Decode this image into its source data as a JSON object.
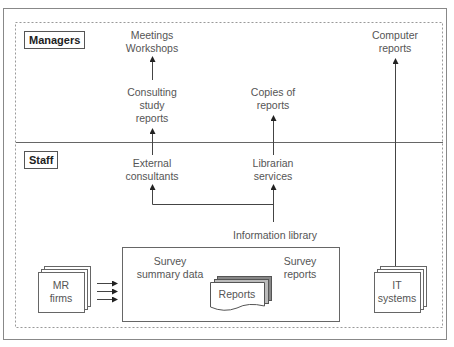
{
  "diagram": {
    "colors": {
      "line": "#555555",
      "frame": "#888888",
      "text": "#555555",
      "shadow": "#999999"
    },
    "zones": {
      "managers": {
        "label": "Managers"
      },
      "staff": {
        "label": "Staff"
      }
    },
    "nodes": {
      "meetings": {
        "lines": [
          "Meetings",
          "Workshops"
        ]
      },
      "consulting_reports": {
        "lines": [
          "Consulting",
          "study",
          "reports"
        ]
      },
      "external_consultants": {
        "lines": [
          "External",
          "consultants"
        ]
      },
      "copies_of_reports": {
        "lines": [
          "Copies of",
          "reports"
        ]
      },
      "librarian_services": {
        "lines": [
          "Librarian",
          "services"
        ]
      },
      "computer_reports": {
        "lines": [
          "Computer",
          "reports"
        ]
      },
      "information_library": {
        "label": "Information library"
      },
      "survey_summary": {
        "lines": [
          "Survey",
          "summary data"
        ]
      },
      "survey_reports": {
        "lines": [
          "Survey",
          "reports"
        ]
      },
      "reports_doc": {
        "label": "Reports"
      },
      "mr_firms": {
        "lines": [
          "MR",
          "firms"
        ]
      },
      "it_systems": {
        "lines": [
          "IT",
          "systems"
        ]
      }
    },
    "edges": [
      {
        "from": "consulting_reports",
        "to": "meetings"
      },
      {
        "from": "external_consultants",
        "to": "consulting_reports"
      },
      {
        "from": "librarian_services",
        "to": "copies_of_reports"
      },
      {
        "from": "information_library",
        "to": "librarian_services"
      },
      {
        "from": "information_library",
        "to": "external_consultants"
      },
      {
        "from": "it_systems",
        "to": "computer_reports"
      },
      {
        "from": "mr_firms",
        "to": "information_library",
        "count": 3
      }
    ]
  }
}
